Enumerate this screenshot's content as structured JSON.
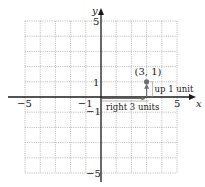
{
  "graph": {
    "x_range": [
      -5,
      5
    ],
    "y_range": [
      -5,
      5
    ],
    "x_axis_label": "x",
    "y_axis_label": "y",
    "x_tick_labels": [
      {
        "value": -5,
        "text": "−5"
      },
      {
        "value": -1,
        "text": "−1"
      },
      {
        "value": 5,
        "text": "5"
      }
    ],
    "y_tick_labels": [
      {
        "value": 5,
        "text": "5"
      },
      {
        "value": 1,
        "text": "1"
      },
      {
        "value": -1,
        "text": "−1"
      },
      {
        "value": -5,
        "text": "−5"
      }
    ],
    "point": {
      "x": 3,
      "y": 1,
      "label": "(3, 1)"
    },
    "annotations": {
      "horizontal_move": "right 3 units",
      "vertical_move": "up 1 unit"
    },
    "colors": {
      "axis": "#1a1a1a",
      "grid": "#9a9a9a",
      "point": "#6e6e6e",
      "arrow": "#6e6e6e"
    }
  }
}
